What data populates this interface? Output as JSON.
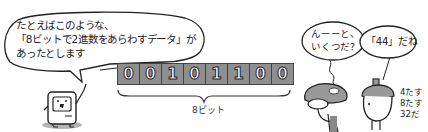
{
  "illustration": {
    "computer_bubble": {
      "lines": [
        "たとえばこのような、",
        "「8ビットで2進数をあらわすデータ」が",
        "あったとします"
      ]
    },
    "bits": [
      "0",
      "0",
      "1",
      "0",
      "1",
      "1",
      "0",
      "0"
    ],
    "brace_label": "8ビット",
    "mushroom_bubble": {
      "lines": [
        "んーーと、",
        "いくつだ？"
      ]
    },
    "acorn_bubble": {
      "text": "「44」だね"
    },
    "acorn_note": {
      "lines": [
        "4たす",
        "8たす",
        "32だ"
      ]
    },
    "colors": {
      "bit_fill": "#8f8f8f",
      "outline": "#222222",
      "shadow": "#b5b5b5",
      "background": "#ffffff"
    }
  }
}
